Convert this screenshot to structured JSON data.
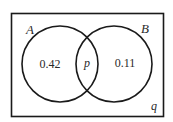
{
  "diagram": {
    "type": "venn",
    "sets": [
      {
        "name": "A",
        "only_value": "0.42"
      },
      {
        "name": "B",
        "only_value": "0.11"
      }
    ],
    "intersection_value": "p",
    "outside_value": "q",
    "stroke_color": "#1a1a1a",
    "background_color": "#ffffff"
  }
}
